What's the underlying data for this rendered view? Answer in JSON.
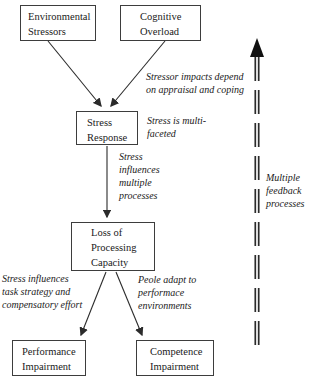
{
  "diagram": {
    "nodes": {
      "environmental_stressors": {
        "label": "Environmental\nStressors"
      },
      "cognitive_overload": {
        "label": "Cognitive\nOverload"
      },
      "stress_response": {
        "label": "Stress\nResponse"
      },
      "loss_of_processing_capacity": {
        "label": "Loss of\nProcessing\nCapacity"
      },
      "performance_impairment": {
        "label": "Performance\nImpairment"
      },
      "competence_impairment": {
        "label": "Competence\nImpairment"
      }
    },
    "annotations": {
      "appraisal_coping": "Stressor impacts depend\non appraisal and coping",
      "multifaceted": "Stress is multi-\nfaceted",
      "influences_processes": "Stress\ninfluences\nmultiple\nprocesses",
      "feedback": "Multiple\nfeedback\nprocesses",
      "task_strategy": "Stress influences\ntask strategy and\ncompensatory effort",
      "adapt": "Peole adapt to\nperformace\nenvironments"
    },
    "colors": {
      "line": "#2b2b2b",
      "box_border": "#3d3d3d",
      "background": "#ffffff",
      "text": "#1a1a1a"
    }
  }
}
